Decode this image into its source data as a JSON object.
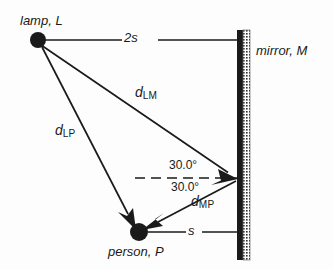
{
  "figure": {
    "background_color": "#fdfdfd",
    "ink_color": "#1a1a1a",
    "width": 333,
    "height": 270
  },
  "labels": {
    "lamp": "lamp, L",
    "mirror": "mirror, M",
    "person": "person, P",
    "distance_lamp_mirror_horizontal": "2s",
    "distance_person_mirror_horizontal": "s",
    "d_lm_symbol": "d",
    "d_lm_subscript": "LM",
    "d_lp_symbol": "d",
    "d_lp_subscript": "LP",
    "d_mp_symbol": "d",
    "d_mp_subscript": "MP",
    "angle_incidence": "30.0°",
    "angle_reflection": "30.0°"
  },
  "points": {
    "lamp": {
      "name": "L",
      "x": 38,
      "y": 40,
      "radius": 8
    },
    "person": {
      "name": "P",
      "x": 139,
      "y": 232,
      "radius": 9
    },
    "mirror_hit": {
      "name": "M",
      "x": 237,
      "y": 178
    }
  },
  "mirror": {
    "x_surface": 237,
    "y_top": 30,
    "y_bottom": 260,
    "bar_width": 6,
    "hatch_width": 7
  },
  "rays": [
    {
      "name": "lamp-to-mirror",
      "label": "d_LM",
      "from": "lamp",
      "to": "mirror_hit",
      "arrow": true
    },
    {
      "name": "mirror-to-person",
      "label": "d_MP",
      "from": "mirror_hit",
      "to": "person",
      "arrow": true
    },
    {
      "name": "lamp-to-person",
      "label": "d_LP",
      "from": "lamp",
      "to": "person",
      "arrow": true
    }
  ],
  "guides": [
    {
      "name": "horizontal-2s",
      "from_x": 45,
      "to_x": 237,
      "y": 40,
      "label": "2s"
    },
    {
      "name": "horizontal-s",
      "from_x": 148,
      "to_x": 237,
      "y": 232,
      "label": "s"
    },
    {
      "name": "normal-dashed",
      "from_x": 135,
      "to_x": 238,
      "y": 178,
      "style": "dashed"
    }
  ]
}
